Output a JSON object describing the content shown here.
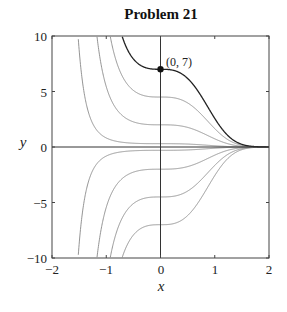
{
  "chart_data": {
    "type": "line",
    "title": "Problem 21",
    "xlabel": "x",
    "ylabel": "y",
    "xlim": [
      -2,
      2
    ],
    "ylim": [
      -10,
      10
    ],
    "xticks": [
      -2,
      -1,
      0,
      1,
      2
    ],
    "yticks": [
      -10,
      -5,
      0,
      5,
      10
    ],
    "xtick_labels": [
      "−2",
      "−1",
      "0",
      "1",
      "2"
    ],
    "ytick_labels": [
      "−10",
      "−5",
      "0",
      "5",
      "10"
    ],
    "grid": false,
    "legend": null,
    "function": "y = C * exp(-x^3)",
    "series": [
      {
        "name": "C = 7 (particular solution)",
        "C": 7,
        "color": "#222222",
        "highlight": true
      },
      {
        "name": "C = 4.5",
        "C": 4.5,
        "color": "#888888"
      },
      {
        "name": "C = 2",
        "C": 2,
        "color": "#888888"
      },
      {
        "name": "C = 0.3",
        "C": 0.3,
        "color": "#888888"
      },
      {
        "name": "C = -0.3",
        "C": -0.3,
        "color": "#888888"
      },
      {
        "name": "C = -2",
        "C": -2,
        "color": "#888888"
      },
      {
        "name": "C = -4.5",
        "C": -4.5,
        "color": "#888888"
      },
      {
        "name": "C = -7",
        "C": -7,
        "color": "#888888"
      }
    ],
    "annotations": [
      {
        "text": "(0, 7)",
        "x": 0,
        "y": 7,
        "marker": "filled-circle"
      }
    ]
  }
}
